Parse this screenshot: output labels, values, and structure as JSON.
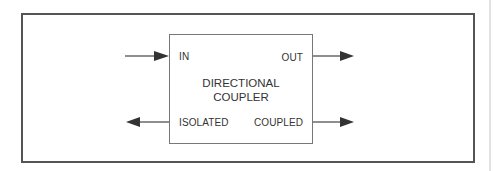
{
  "diagram": {
    "block": {
      "title_line1": "DIRECTIONAL",
      "title_line2": "COUPLER"
    },
    "ports": {
      "in": "IN",
      "out": "OUT",
      "isolated": "ISOLATED",
      "coupled": "COUPLED"
    },
    "arrows": [
      {
        "port": "in",
        "direction": "into-block"
      },
      {
        "port": "out",
        "direction": "out-of-block"
      },
      {
        "port": "isolated",
        "direction": "out-of-block"
      },
      {
        "port": "coupled",
        "direction": "out-of-block"
      }
    ],
    "colors": {
      "frame": "#555555",
      "block": "#777777",
      "arrow": "#333333",
      "text": "#333333"
    }
  }
}
